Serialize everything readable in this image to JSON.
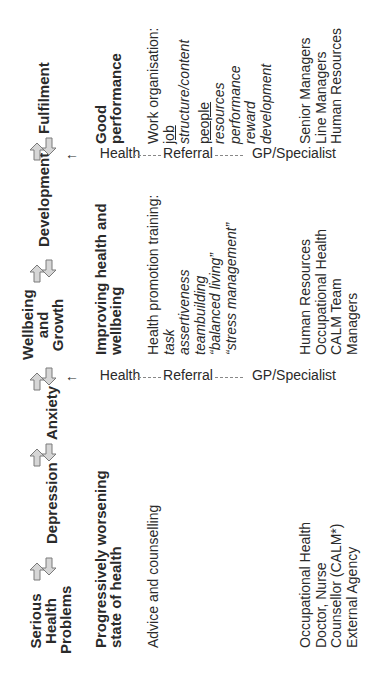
{
  "stages": [
    {
      "label": "Serious Health Problems",
      "lines": [
        "Serious",
        "Health",
        "Problems"
      ]
    },
    {
      "label": "Depression",
      "lines": [
        "Depression"
      ]
    },
    {
      "label": "Anxiety",
      "lines": [
        "Anxiety"
      ]
    },
    {
      "label": "Wellbeing and Growth",
      "lines": [
        "Wellbeing",
        "and",
        "Growth"
      ]
    },
    {
      "label": "Development",
      "lines": [
        "Development"
      ]
    },
    {
      "label": "Fulfilment",
      "lines": [
        "Fulfilment"
      ]
    }
  ],
  "arrow_icons": "double-arrow-forward-back",
  "row_titles": {
    "left": [
      "Progressively worsening",
      "state of health"
    ],
    "middle": [
      "Improving health and",
      "wellbeing"
    ],
    "right": [
      "Good",
      "performance"
    ]
  },
  "interventions": {
    "left": [
      "Advice and counselling"
    ],
    "middle": {
      "heading": "Health promotion training:",
      "items": [
        "task",
        "assertiveness",
        "teambuilding",
        "“balanced living”",
        "“stress management”"
      ]
    },
    "right": {
      "heading": "Work organisation:",
      "items": [
        {
          "text": "job",
          "style": "underline"
        },
        {
          "text": "structure/content",
          "style": "italic"
        },
        {
          "text": "people",
          "style": "underline"
        },
        {
          "text": "resources",
          "style": "italic"
        },
        {
          "text": "performance",
          "style": "italic"
        },
        {
          "text": "reward",
          "style": "italic"
        },
        {
          "text": "development",
          "style": "italic"
        }
      ]
    }
  },
  "providers": {
    "left": [
      "Occupational Health",
      "Doctor, Nurse",
      "Counsellor (CALM*)",
      "External Agency"
    ],
    "middle": [
      "Human Resources",
      "Occupational Health",
      "CALM Team",
      "Managers"
    ],
    "right": [
      "Senior Managers",
      "Line Managers",
      "Human Resources"
    ]
  },
  "dividers": [
    {
      "health": "Health",
      "referral": "Referral",
      "specialist": "GP/Specialist",
      "arrow": "←"
    },
    {
      "health": "Health",
      "referral": "Referral",
      "specialist": "GP/Specialist",
      "arrow": "←"
    }
  ],
  "colors": {
    "text": "#2a2a2a",
    "arrow_fill": "#d6d6d6",
    "arrow_stroke": "#7a7a7a",
    "dash": "#888888"
  }
}
